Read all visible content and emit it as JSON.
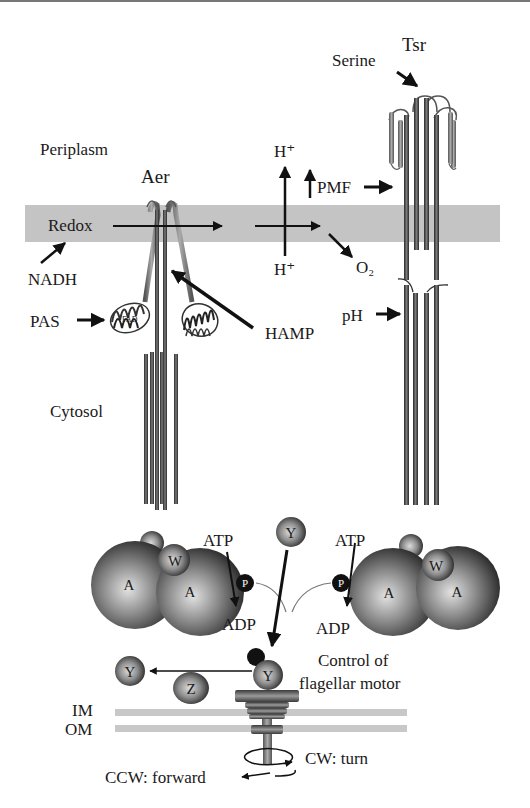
{
  "figure": {
    "regions": {
      "periplasm": "Periplasm",
      "cytosol": "Cytosol",
      "inner_membrane": "IM",
      "outer_membrane": "OM"
    },
    "receptors": {
      "aer": "Aer",
      "tsr": "Tsr"
    },
    "signals": {
      "redox": "Redox",
      "nadh": "NADH",
      "pas": "PAS",
      "fad": "FAD",
      "hamp": "HAMP",
      "h_plus_top": "H⁺",
      "h_plus_bottom": "H⁺",
      "pmf": "PMF",
      "o2": "O₂",
      "serine": "Serine",
      "ph": "pH"
    },
    "kinase_complex_left": {
      "a1": "A",
      "a2": "A",
      "w": "W",
      "p": "P",
      "atp": "ATP",
      "adp": "ADP"
    },
    "kinase_complex_right": {
      "a1": "A",
      "a2": "A",
      "w": "W",
      "p": "P",
      "atp": "ATP",
      "adp": "ADP"
    },
    "response_regulators": {
      "y_free": "Y",
      "y_bound": "Y",
      "y_dephos": "Y",
      "z": "Z"
    },
    "motor": {
      "control_label_line1": "Control of",
      "control_label_line2": "flagellar motor",
      "cw": "CW: turn",
      "ccw": "CCW: forward"
    }
  },
  "colors": {
    "membrane": "#c4c4c4",
    "thin_membrane": "#c8c8c8",
    "ink": "#111111",
    "sphere_dark": "#1e1e1e",
    "sphere_light": "#d8d8d8"
  }
}
